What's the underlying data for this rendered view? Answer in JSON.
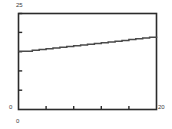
{
  "chart_data": {
    "type": "line",
    "title": "",
    "subtitle": "",
    "xlabel": "",
    "ylabel": "",
    "xlim": [
      0,
      20
    ],
    "ylim": [
      0,
      25
    ],
    "grid": false,
    "legend": null,
    "line_color": "#4a4a4a",
    "frame_color": "#2b2b2b",
    "step_style": "staircase",
    "x": [
      0,
      1,
      2,
      3,
      4,
      5,
      6,
      7,
      8,
      9,
      10,
      11,
      12,
      13,
      14,
      15,
      16,
      17,
      18,
      19,
      20
    ],
    "values": [
      15.2,
      15.2,
      15.4,
      15.6,
      15.8,
      16.0,
      16.2,
      16.4,
      16.6,
      16.8,
      17.0,
      17.2,
      17.4,
      17.6,
      17.8,
      18.0,
      18.2,
      18.4,
      18.6,
      18.8,
      19.0
    ],
    "series": [
      {
        "name": "series-1",
        "values": [
          15.2,
          15.2,
          15.4,
          15.6,
          15.8,
          16.0,
          16.2,
          16.4,
          16.6,
          16.8,
          17.0,
          17.2,
          17.4,
          17.6,
          17.8,
          18.0,
          18.2,
          18.4,
          18.6,
          18.8,
          19.0
        ]
      }
    ],
    "x_ticks": [
      0,
      4,
      8,
      12,
      16,
      20
    ],
    "y_ticks": [
      0,
      5,
      10,
      15,
      20,
      25
    ]
  },
  "axes": {
    "y_max_label": "25",
    "y_min_label": "0",
    "x_min_label": "0",
    "x_max_label": "20"
  }
}
